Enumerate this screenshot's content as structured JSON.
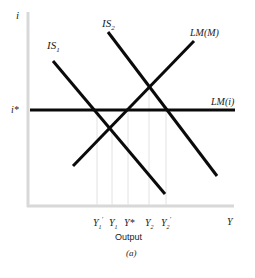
{
  "figure": {
    "panel_label": "(a)",
    "x_axis_title": "Output",
    "x_axis_symbol": "Y",
    "y_axis_symbol": "i",
    "colors": {
      "curve": "#0a0a0a",
      "axis": "#d8d8d8",
      "guide": "#e2e2e2",
      "text": "#222222"
    }
  },
  "curves": {
    "is1": {
      "label": "IS",
      "sub": "1"
    },
    "is2": {
      "label": "IS",
      "sub": "2"
    },
    "lmm": {
      "label": "LM(M)"
    },
    "lmi": {
      "label": "LM(i)"
    }
  },
  "y_ticks": {
    "istar": "i*"
  },
  "x_ticks": [
    {
      "base": "Y",
      "sub": "1",
      "sup": "′"
    },
    {
      "base": "Y",
      "sub": "1",
      "sup": ""
    },
    {
      "base": "Y*",
      "sub": "",
      "sup": ""
    },
    {
      "base": "Y",
      "sub": "2",
      "sup": ""
    },
    {
      "base": "Y",
      "sub": "2",
      "sup": "′"
    }
  ]
}
